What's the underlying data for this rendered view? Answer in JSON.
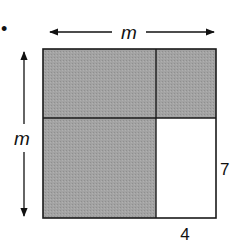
{
  "diagram": {
    "bullet": "•",
    "labels": {
      "top_dimension": "m",
      "left_dimension": "m",
      "right_segment": "7",
      "bottom_segment": "4"
    },
    "colors": {
      "shaded": "#9e9e9e",
      "unshaded": "#ffffff",
      "stroke": "#1a1a1a"
    },
    "regions": [
      {
        "name": "top-left",
        "shaded": true
      },
      {
        "name": "top-right",
        "shaded": true
      },
      {
        "name": "bottom-left",
        "shaded": true
      },
      {
        "name": "bottom-right",
        "shaded": false
      }
    ]
  }
}
